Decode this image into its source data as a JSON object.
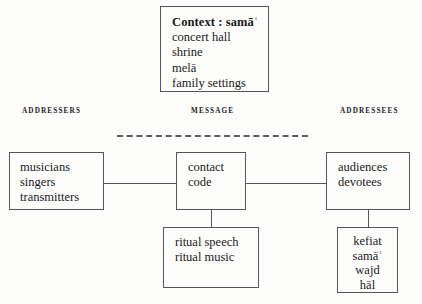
{
  "diagram": {
    "context_box": {
      "title": "Context : samāʿ",
      "items": [
        "concert hall",
        "shrine",
        "melā",
        "family settings"
      ]
    },
    "column_labels": {
      "addressers": "ADDRESSERS",
      "message": "MESSAGE",
      "addressees": "ADDRESSEES"
    },
    "addressers_box": {
      "items": [
        "musicians",
        "singers",
        "transmitters"
      ]
    },
    "message_box": {
      "items": [
        "contact",
        "code"
      ]
    },
    "addressees_box": {
      "items": [
        "audiences",
        "devotees"
      ]
    },
    "message_detail_box": {
      "items": [
        "ritual speech",
        "ritual music"
      ]
    },
    "addressees_detail_box": {
      "items": [
        "kefiat",
        "samāʿ",
        "wajd",
        "hāl"
      ]
    },
    "colors": {
      "stroke": "#55565a",
      "text": "#1a1a1a",
      "background": "#fdfdfc"
    }
  }
}
